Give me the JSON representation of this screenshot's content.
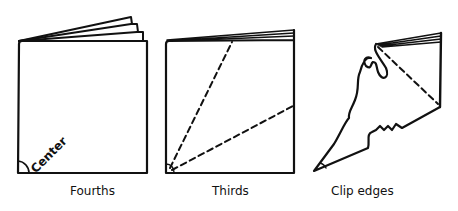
{
  "figures": [
    {
      "id": "fourths",
      "caption": "Fourths",
      "annotation": "Center"
    },
    {
      "id": "thirds",
      "caption": "Thirds"
    },
    {
      "id": "clip",
      "caption": "Clip edges"
    }
  ],
  "colors": {
    "ink": "#111111",
    "background": "#ffffff"
  }
}
